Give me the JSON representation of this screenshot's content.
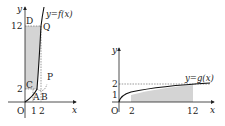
{
  "left_graph": {
    "y_axis_label": "y",
    "x_axis_label": "x",
    "origin_label": "O",
    "curve_label": "y=f(x)",
    "x_ticks": [
      "1",
      "2"
    ],
    "y_ticks": [
      "2",
      "12"
    ],
    "points": {
      "D": "D",
      "Q": "Q",
      "C": "C",
      "P": "P",
      "A": "A",
      "B": "B"
    }
  },
  "right_graph": {
    "y_axis_label": "y",
    "x_axis_label": "x",
    "origin_label": "O",
    "curve_label": "y=g(x)",
    "x_ticks": [
      "2",
      "12"
    ],
    "y_ticks": [
      "1",
      "2"
    ]
  },
  "colors": {
    "ink": "#222222",
    "shade": "#d4d4d4",
    "dash": "#555555"
  }
}
